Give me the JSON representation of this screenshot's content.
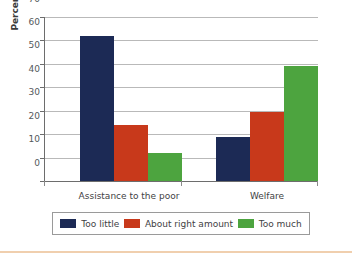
{
  "chart_data": {
    "type": "bar",
    "title": "",
    "subtitle": "",
    "xlabel": "",
    "ylabel": "Percent of Americans",
    "categories": [
      "Assistance to the poor",
      "Welfare"
    ],
    "series": [
      {
        "name": "Too little",
        "color": "#1c2a55",
        "values": [
          62,
          19
        ]
      },
      {
        "name": "About right amount",
        "color": "#c8391b",
        "values": [
          24,
          29.5
        ]
      },
      {
        "name": "Too much",
        "color": "#4da43f",
        "values": [
          12,
          49
        ]
      }
    ],
    "ylim": [
      0,
      70
    ],
    "yticks": [
      0,
      10,
      20,
      30,
      40,
      50,
      60,
      70
    ],
    "ytick_labels": [
      "0",
      "10",
      "20",
      "30",
      "40",
      "50",
      "60",
      "70"
    ],
    "grid": true,
    "grid_axis": "y",
    "legend_position": "bottom",
    "legend_entries": [
      "Too little",
      "About right amount",
      "Too much"
    ]
  },
  "axis": {
    "y_title": "Percent of Americans",
    "y_labels": {
      "t0": "0",
      "t10": "10",
      "t20": "20",
      "t30": "30",
      "t40": "40",
      "t50": "50",
      "t60": "60",
      "t70": "70"
    },
    "x_labels": {
      "g0": "Assistance to the poor",
      "g1": "Welfare"
    }
  },
  "legend": {
    "items": [
      {
        "label": "Too little",
        "color": "#1c2a55"
      },
      {
        "label": "About right amount",
        "color": "#c8391b"
      },
      {
        "label": "Too much",
        "color": "#4da43f"
      }
    ]
  }
}
